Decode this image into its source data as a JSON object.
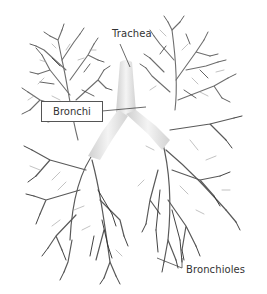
{
  "diagram": {
    "labels": {
      "trachea": "Trachea",
      "bronchi": "Bronchi",
      "bronchioles": "Bronchioles"
    },
    "colors": {
      "branches_dark": "#3a3a3a",
      "branches_mid": "#6e6e6e",
      "branches_light": "#a8a8a8",
      "airway": "#e6e6e6",
      "leader_line": "#444444",
      "background": "#ffffff"
    }
  }
}
